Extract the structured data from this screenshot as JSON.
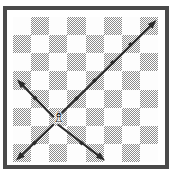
{
  "figure": {
    "width": 174,
    "height": 175,
    "background_color": "#ffffff",
    "frame_color": "#4a4a4a",
    "frame_style": "double-rule border with white inset"
  },
  "board": {
    "type": "chessboard",
    "files": 8,
    "ranks": 8,
    "light_square_color": "#fdfdfd",
    "dark_square_color": "#8b8b8b",
    "dark_square_fill": "dithered-halftone-50",
    "origin_square_color": "light",
    "square_size_px": 18.1,
    "pattern_note": "top-left square is light; colors alternate",
    "squares": [
      [
        "light",
        "dark",
        "light",
        "dark",
        "light",
        "dark",
        "light",
        "dark"
      ],
      [
        "dark",
        "light",
        "dark",
        "light",
        "dark",
        "light",
        "dark",
        "light"
      ],
      [
        "light",
        "dark",
        "light",
        "dark",
        "light",
        "dark",
        "light",
        "dark"
      ],
      [
        "dark",
        "light",
        "dark",
        "light",
        "dark",
        "light",
        "dark",
        "light"
      ],
      [
        "light",
        "dark",
        "light",
        "dark",
        "light",
        "dark",
        "light",
        "dark"
      ],
      [
        "dark",
        "light",
        "dark",
        "light",
        "dark",
        "light",
        "dark",
        "light"
      ],
      [
        "light",
        "dark",
        "light",
        "dark",
        "light",
        "dark",
        "light",
        "dark"
      ],
      [
        "dark",
        "light",
        "dark",
        "light",
        "dark",
        "light",
        "dark",
        "light"
      ]
    ]
  },
  "piece": {
    "name": "bishop",
    "color": "white",
    "glyph": "♗",
    "label": "Bishop",
    "column_index": 2,
    "row_index": 5,
    "square_label": "c3"
  },
  "arrows": {
    "color": "#2b2b2b",
    "stroke_width": 2.2,
    "head_length": 9,
    "count": 4,
    "description": "Four diagonal rays radiating from the bishop square",
    "items": [
      {
        "name": "arrow-up-right",
        "direction": "up-right",
        "from_x": 45.2,
        "from_y": 99.5,
        "to_x": 143.5,
        "to_y": 3.0,
        "squares_travelled": 5,
        "midpoint_markers": [
          {
            "x": 63.5,
            "y": 81.5
          },
          {
            "x": 81.5,
            "y": 63.5
          },
          {
            "x": 99.5,
            "y": 45.5
          },
          {
            "x": 117.5,
            "y": 27.5
          }
        ]
      },
      {
        "name": "arrow-up-left",
        "direction": "up-left",
        "from_x": 40.0,
        "from_y": 99.5,
        "to_x": 4.0,
        "to_y": 62.5,
        "squares_travelled": 2,
        "midpoint_markers": [
          {
            "x": 22.0,
            "y": 81.0
          }
        ]
      },
      {
        "name": "arrow-down-left",
        "direction": "down-left",
        "from_x": 40.0,
        "from_y": 108.0,
        "to_x": 3.0,
        "to_y": 143.5,
        "squares_travelled": 2,
        "midpoint_markers": [
          {
            "x": 21.5,
            "y": 126.0
          }
        ]
      },
      {
        "name": "arrow-down-right",
        "direction": "down-right",
        "from_x": 45.5,
        "from_y": 108.0,
        "to_x": 92.0,
        "to_y": 143.5,
        "squares_travelled": 2,
        "midpoint_markers": [
          {
            "x": 68.5,
            "y": 126.0
          }
        ]
      }
    ]
  },
  "accessibility": {
    "alt_text": "Chess diagram: a bishop on a dithered eight by eight board with four arrows showing its diagonal lines of movement."
  }
}
